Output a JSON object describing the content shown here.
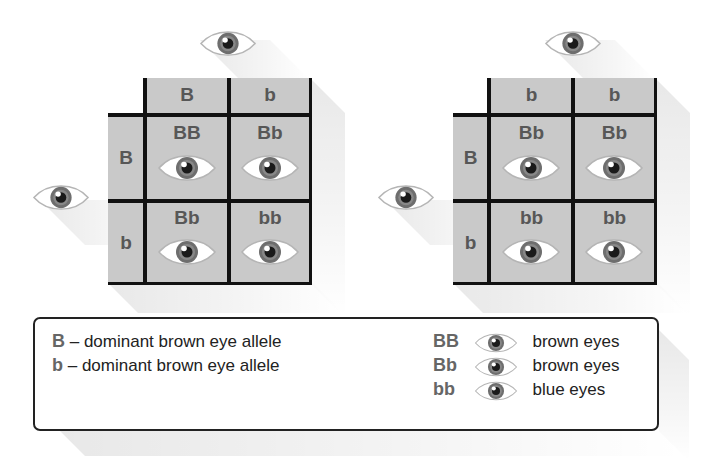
{
  "grids": [
    {
      "parent_top_allele": "B b",
      "top_headers": [
        "B",
        "b"
      ],
      "side_headers": [
        "B",
        "b"
      ],
      "cells": [
        [
          "BB",
          "Bb"
        ],
        [
          "Bb",
          "bb"
        ]
      ]
    },
    {
      "top_headers": [
        "b",
        "b"
      ],
      "side_headers": [
        "B",
        "b"
      ],
      "cells": [
        [
          "Bb",
          "Bb"
        ],
        [
          "bb",
          "bb"
        ]
      ]
    }
  ],
  "legend": {
    "alleles": [
      {
        "symbol": "B",
        "desc": "– dominant brown eye allele"
      },
      {
        "symbol": "b",
        "desc": "– dominant brown eye allele"
      }
    ],
    "phenotypes": [
      {
        "genotype": "BB",
        "icon": "eye-icon",
        "label": "brown eyes"
      },
      {
        "genotype": "Bb",
        "icon": "eye-icon",
        "label": "brown eyes"
      },
      {
        "genotype": "bb",
        "icon": "eye-icon",
        "label": "blue eyes"
      }
    ]
  },
  "colors": {
    "cell_fill": "#c9c9c9",
    "grid_line": "#111111",
    "label_text": "#575757",
    "iris": "#6e6e6e",
    "pupil": "#1a1a1a"
  }
}
